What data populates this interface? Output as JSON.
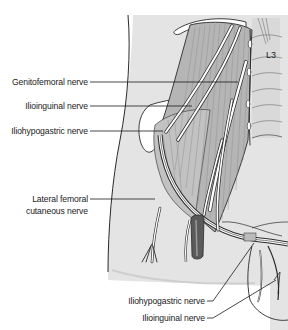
{
  "figure": {
    "type": "anatomical illustration",
    "vertebra_label": "L3",
    "colors": {
      "skin": "#e4e4e4",
      "muscle": "#b4b4b4",
      "muscle_light": "#cdcdcd",
      "vertebra": "#dadada",
      "nerve": "#ffffff",
      "outline": "#2a2a2a",
      "leader_line": "#1a1a1a",
      "vessel_dark": "#5a5a5a"
    }
  },
  "labels": {
    "genitofemoral": "Genitofemoral nerve",
    "ilioinguinal_upper": "Ilioinguinal nerve",
    "iliohypogastric_upper": "Iliohypogastric nerve",
    "lateral_femoral_line1": "Lateral femoral",
    "lateral_femoral_line2": "cutaneous nerve",
    "iliohypogastric_lower": "Iliohypogastric nerve",
    "ilioinguinal_lower": "Ilioinguinal nerve"
  }
}
